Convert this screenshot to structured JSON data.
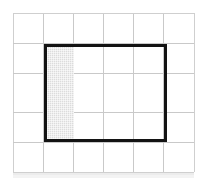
{
  "figure": {
    "title": "Shaded fraction of a rectangle on a square grid",
    "caption": "",
    "background_color": "#ffffff"
  },
  "grid": {
    "columns": 6,
    "rows": 5,
    "cell_width": 30,
    "cell_height": 30,
    "origin_x": 13,
    "origin_y": 13,
    "line_color": "#c9c9c9",
    "frame_color": "#cfcfcf",
    "show_grid": true,
    "vertical_line_positions": [
      13,
      43,
      73,
      103,
      133,
      163,
      194
    ],
    "horizontal_line_positions": [
      13,
      43,
      73,
      112,
      142,
      172
    ]
  },
  "rectangle": {
    "label": "",
    "stroke_color": "#131313",
    "stroke_width": 3,
    "x": 44,
    "y": 44,
    "width": 123,
    "height": 98,
    "columns_spanned": 4,
    "rows_spanned": 3,
    "total_cells": 12
  },
  "shaded": {
    "label": "",
    "fill_color": "#dcdcdc",
    "pattern": "fine-dither",
    "x": 47,
    "y": 47,
    "width": 27,
    "height": 92,
    "columns_spanned": 1,
    "rows_spanned": 3,
    "cells_shaded": 3,
    "fraction": "3/12"
  },
  "paper": {
    "band_color": "#e9e9e9",
    "band_faint_color": "#f1f1f1"
  },
  "icons": {
    "grid_icon": "grid-icon",
    "rectangle_icon": "rectangle-icon",
    "shading_icon": "shading-swatch-icon"
  }
}
